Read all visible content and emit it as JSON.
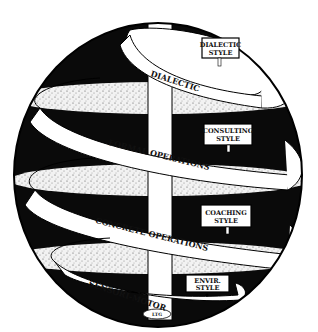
{
  "diagram": {
    "type": "spiral-development-sphere",
    "colors": {
      "background": "#ffffff",
      "ink": "#0a0a0a",
      "ribbon": "#ffffff",
      "stipple": "#e8e8e8"
    },
    "levels": [
      {
        "label": "DIALECTIC",
        "sign": {
          "line1": "DIALECTIC",
          "line2": "STYLE"
        }
      },
      {
        "label": "FORMAL OPERATIONS",
        "sign": {
          "line1": "CONSULTING",
          "line2": "STYLE"
        }
      },
      {
        "label": "CONCRETE OPERATIONS",
        "sign": {
          "line1": "COACHING",
          "line2": "STYLE"
        }
      },
      {
        "label": "SENSORI-MOTOR",
        "sign": {
          "line1": "ENVIR.",
          "line2": "STYLE"
        }
      }
    ],
    "base_label": "LTG"
  }
}
